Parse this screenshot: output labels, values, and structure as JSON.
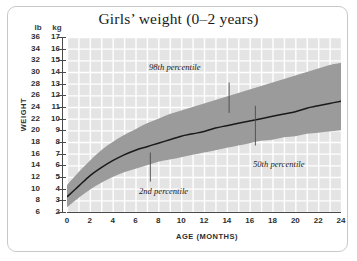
{
  "chart_data": {
    "type": "area",
    "title": "Girls’ weight (0–2 years)",
    "xlabel": "AGE (MONTHS)",
    "ylabel": "WEIGHT",
    "y_unit_primary": "kg",
    "y_unit_secondary": "lb",
    "grid": true,
    "legend_position": "inline-annotations",
    "xlim": [
      0,
      24
    ],
    "ylim_kg": [
      2,
      17
    ],
    "ylim_lb": [
      6,
      36
    ],
    "x_ticks": [
      0,
      2,
      4,
      6,
      8,
      10,
      12,
      14,
      16,
      18,
      20,
      22,
      24
    ],
    "y_ticks_kg": [
      2,
      3,
      4,
      5,
      6,
      7,
      8,
      9,
      10,
      11,
      12,
      13,
      14,
      15,
      16,
      17
    ],
    "y_ticks_lb": [
      6,
      8,
      10,
      12,
      14,
      16,
      18,
      20,
      22,
      24,
      26,
      28,
      30,
      32,
      34,
      36
    ],
    "x": [
      0,
      1,
      2,
      3,
      4,
      5,
      6,
      7,
      8,
      9,
      10,
      11,
      12,
      13,
      14,
      15,
      16,
      17,
      18,
      19,
      20,
      21,
      22,
      23,
      24
    ],
    "series": [
      {
        "name": "2nd percentile",
        "unit": "kg",
        "values": [
          2.4,
          3.2,
          3.9,
          4.5,
          5.0,
          5.4,
          5.7,
          6.0,
          6.3,
          6.5,
          6.7,
          6.9,
          7.1,
          7.3,
          7.5,
          7.7,
          7.9,
          8.1,
          8.2,
          8.4,
          8.5,
          8.7,
          8.8,
          8.9,
          9.0
        ]
      },
      {
        "name": "50th percentile",
        "unit": "kg",
        "values": [
          3.3,
          4.2,
          5.1,
          5.8,
          6.4,
          6.9,
          7.3,
          7.6,
          7.9,
          8.2,
          8.5,
          8.7,
          8.9,
          9.2,
          9.4,
          9.6,
          9.8,
          10.0,
          10.2,
          10.4,
          10.6,
          10.9,
          11.1,
          11.3,
          11.5
        ]
      },
      {
        "name": "98th percentile",
        "unit": "kg",
        "values": [
          4.3,
          5.4,
          6.4,
          7.3,
          8.0,
          8.6,
          9.1,
          9.6,
          10.0,
          10.4,
          10.7,
          11.0,
          11.3,
          11.6,
          11.9,
          12.2,
          12.5,
          12.8,
          13.1,
          13.4,
          13.7,
          14.0,
          14.3,
          14.6,
          14.8
        ]
      }
    ],
    "annotations": [
      {
        "text": "98th percentile",
        "x_month": 14.2,
        "y_kg": 13.8
      },
      {
        "text": "2nd percentile",
        "x_month": 7.3,
        "y_kg": 4.2
      },
      {
        "text": "50th percentile",
        "x_month": 16.5,
        "y_kg": 7.2
      }
    ],
    "colors": {
      "band": "#9b9b9b",
      "median_line": "#1a1a1a",
      "plot_background": "#e4e4e4",
      "gridline": "#ffffff",
      "axis": "#4a4a4a",
      "text": "#2e2e2e",
      "frame": "#c9c9c9"
    }
  }
}
